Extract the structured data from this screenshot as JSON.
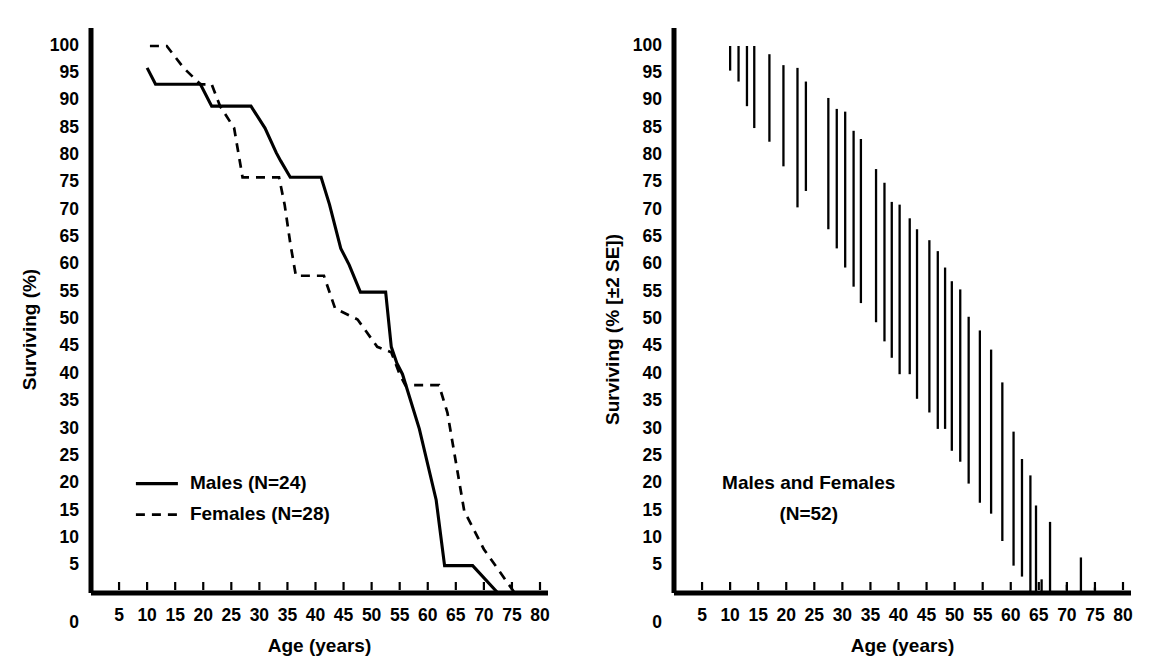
{
  "figure": {
    "width": 1165,
    "height": 667,
    "background": "#ffffff",
    "ink_color": "#000000"
  },
  "chart_data": [
    {
      "id": "left-panel",
      "type": "line",
      "title": "",
      "xlabel": "Age (years)",
      "ylabel": "Surviving (%)",
      "xlim": [
        0,
        80
      ],
      "ylim": [
        0,
        100
      ],
      "xticks": [
        5,
        10,
        15,
        20,
        25,
        30,
        35,
        40,
        45,
        50,
        55,
        60,
        65,
        70,
        75,
        80
      ],
      "xtick_labels": [
        "5",
        "10",
        "15",
        "20",
        "25",
        "30",
        "35",
        "40",
        "45",
        "50",
        "55",
        "60",
        "65",
        "70",
        "75",
        "80"
      ],
      "x_origin_label": "0",
      "yticks": [
        5,
        10,
        15,
        20,
        25,
        30,
        35,
        40,
        45,
        50,
        55,
        60,
        65,
        70,
        75,
        80,
        85,
        90,
        95,
        100
      ],
      "ytick_labels": [
        "5",
        "10",
        "15",
        "20",
        "25",
        "30",
        "35",
        "40",
        "45",
        "50",
        "55",
        "60",
        "65",
        "70",
        "75",
        "80",
        "85",
        "90",
        "95",
        "100"
      ],
      "y_origin_label": "0",
      "grid": false,
      "legend_position": "lower-left",
      "legend": [
        {
          "label": "Males (N=24)",
          "style": "solid"
        },
        {
          "label": "Females (N=28)",
          "style": "dashed"
        }
      ],
      "series": [
        {
          "name": "Males (N=24)",
          "style": "solid",
          "points": [
            [
              10.0,
              96.0
            ],
            [
              11.5,
              93.0
            ],
            [
              19.5,
              93.0
            ],
            [
              21.5,
              89.0
            ],
            [
              28.5,
              89.0
            ],
            [
              31.0,
              85.0
            ],
            [
              33.0,
              80.5
            ],
            [
              33.8,
              79.0
            ],
            [
              35.5,
              76.0
            ],
            [
              41.0,
              76.0
            ],
            [
              42.5,
              71.0
            ],
            [
              44.5,
              63.0
            ],
            [
              46.0,
              60.0
            ],
            [
              48.0,
              55.0
            ],
            [
              52.5,
              55.0
            ],
            [
              53.5,
              45.0
            ],
            [
              54.5,
              42.0
            ],
            [
              55.5,
              40.0
            ],
            [
              58.5,
              30.0
            ],
            [
              61.5,
              17.0
            ],
            [
              63.0,
              5.0
            ],
            [
              68.0,
              5.0
            ],
            [
              72.5,
              0.0
            ],
            [
              80.0,
              0.0
            ]
          ]
        },
        {
          "name": "Females (N=28)",
          "style": "dashed",
          "points": [
            [
              10.5,
              100.0
            ],
            [
              13.5,
              100.0
            ],
            [
              16.5,
              96.0
            ],
            [
              19.5,
              93.0
            ],
            [
              21.5,
              93.0
            ],
            [
              23.0,
              89.0
            ],
            [
              25.5,
              85.0
            ],
            [
              27.0,
              76.0
            ],
            [
              33.5,
              76.0
            ],
            [
              34.5,
              71.0
            ],
            [
              35.5,
              64.0
            ],
            [
              36.5,
              58.0
            ],
            [
              41.5,
              58.0
            ],
            [
              43.5,
              52.0
            ],
            [
              47.5,
              50.0
            ],
            [
              51.0,
              45.0
            ],
            [
              53.5,
              44.0
            ],
            [
              55.0,
              40.0
            ],
            [
              56.0,
              38.0
            ],
            [
              62.0,
              38.0
            ],
            [
              63.5,
              33.0
            ],
            [
              65.0,
              24.0
            ],
            [
              66.5,
              15.0
            ],
            [
              70.0,
              8.0
            ],
            [
              75.5,
              0.0
            ],
            [
              80.0,
              0.0
            ]
          ]
        }
      ]
    },
    {
      "id": "right-panel",
      "type": "errorbar",
      "title": "",
      "xlabel": "Age (years)",
      "ylabel": "Surviving (% [±2 SE])",
      "xlim": [
        0,
        80
      ],
      "ylim": [
        0,
        100
      ],
      "xticks": [
        5,
        10,
        15,
        20,
        25,
        30,
        35,
        40,
        45,
        50,
        55,
        60,
        65,
        70,
        75,
        80
      ],
      "xtick_labels": [
        "5",
        "10",
        "15",
        "20",
        "25",
        "30",
        "35",
        "40",
        "45",
        "50",
        "55",
        "60",
        "65",
        "70",
        "75",
        "80"
      ],
      "x_origin_label": "0",
      "yticks": [
        5,
        10,
        15,
        20,
        25,
        30,
        35,
        40,
        45,
        50,
        55,
        60,
        65,
        70,
        75,
        80,
        85,
        90,
        95,
        100
      ],
      "ytick_labels": [
        "5",
        "10",
        "15",
        "20",
        "25",
        "30",
        "35",
        "40",
        "45",
        "50",
        "55",
        "60",
        "65",
        "70",
        "75",
        "80",
        "85",
        "90",
        "95",
        "100"
      ],
      "y_origin_label": "0",
      "grid": false,
      "annotation_lines": [
        "Males and Females",
        "(N=52)"
      ],
      "annotation_x": 24,
      "annotation_y": 20,
      "bars": [
        {
          "x": 10.0,
          "low": 95.5,
          "high": 100.0
        },
        {
          "x": 11.5,
          "low": 93.5,
          "high": 100.0
        },
        {
          "x": 13.0,
          "low": 89.0,
          "high": 100.0
        },
        {
          "x": 14.3,
          "low": 85.0,
          "high": 100.0
        },
        {
          "x": 17.0,
          "low": 82.5,
          "high": 98.5
        },
        {
          "x": 19.5,
          "low": 78.0,
          "height_note": "",
          "high": 96.5
        },
        {
          "x": 22.0,
          "low": 70.5,
          "high": 96.0
        },
        {
          "x": 23.5,
          "low": 73.5,
          "high": 93.5
        },
        {
          "x": 27.5,
          "low": 66.5,
          "high": 90.5
        },
        {
          "x": 29.0,
          "low": 63.0,
          "high": 88.5
        },
        {
          "x": 30.5,
          "low": 59.5,
          "high": 88.0
        },
        {
          "x": 32.0,
          "low": 56.0,
          "high": 84.5
        },
        {
          "x": 33.3,
          "low": 53.0,
          "high": 83.0
        },
        {
          "x": 36.0,
          "low": 49.5,
          "high": 77.5
        },
        {
          "x": 37.5,
          "low": 46.0,
          "high": 75.0
        },
        {
          "x": 38.8,
          "low": 43.0,
          "high": 71.5
        },
        {
          "x": 40.2,
          "low": 40.0,
          "high": 71.0
        },
        {
          "x": 42.0,
          "low": 40.0,
          "high": 68.5
        },
        {
          "x": 43.3,
          "low": 35.5,
          "high": 66.5
        },
        {
          "x": 45.5,
          "low": 33.0,
          "high": 64.5
        },
        {
          "x": 47.0,
          "low": 30.0,
          "high": 62.5
        },
        {
          "x": 48.3,
          "low": 30.0,
          "high": 59.5
        },
        {
          "x": 49.5,
          "low": 26.0,
          "high": 57.0
        },
        {
          "x": 51.0,
          "low": 24.0,
          "high": 55.5
        },
        {
          "x": 52.5,
          "low": 20.0,
          "high": 50.5
        },
        {
          "x": 54.5,
          "low": 16.5,
          "high": 48.0
        },
        {
          "x": 56.5,
          "low": 14.5,
          "high": 44.5
        },
        {
          "x": 58.5,
          "low": 9.5,
          "high": 38.5
        },
        {
          "x": 60.5,
          "low": 5.0,
          "high": 29.5
        },
        {
          "x": 62.0,
          "low": 3.0,
          "high": 24.5
        },
        {
          "x": 63.5,
          "low": 0.0,
          "high": 21.5
        },
        {
          "x": 64.5,
          "low": 0.0,
          "high": 16.0
        },
        {
          "x": 65.5,
          "low": 0.0,
          "high": 2.5
        },
        {
          "x": 67.0,
          "low": 0.0,
          "high": 13.0
        },
        {
          "x": 70.0,
          "low": 0.0,
          "high": 1.5
        },
        {
          "x": 72.5,
          "low": 0.0,
          "high": 6.5
        },
        {
          "x": 75.0,
          "low": 0.0,
          "high": 1.0
        }
      ]
    }
  ]
}
